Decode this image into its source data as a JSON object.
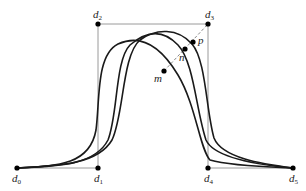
{
  "diagram": {
    "type": "spline control polygon with curves",
    "control_points": [
      {
        "id": "d0",
        "label": "d",
        "sub": "0",
        "x": 17,
        "y": 168
      },
      {
        "id": "d1",
        "label": "d",
        "sub": "1",
        "x": 98,
        "y": 168
      },
      {
        "id": "d2",
        "label": "d",
        "sub": "2",
        "x": 98,
        "y": 24
      },
      {
        "id": "d3",
        "label": "d",
        "sub": "3",
        "x": 208,
        "y": 24
      },
      {
        "id": "d4",
        "label": "d",
        "sub": "4",
        "x": 208,
        "y": 168
      },
      {
        "id": "d5",
        "label": "d",
        "sub": "5",
        "x": 293,
        "y": 168
      }
    ],
    "curve_points": [
      {
        "id": "m",
        "label": "m",
        "x": 164,
        "y": 71
      },
      {
        "id": "n",
        "label": "n",
        "x": 185,
        "y": 49
      },
      {
        "id": "p",
        "label": "p",
        "x": 193,
        "y": 42
      }
    ],
    "curves": [
      {
        "name": "curve-1",
        "path": "M17,168 C60,166 90,164 96,130 C100,100 96,55 118,44 C140,34 160,45 178,75 C196,105 200,150 210,160 C230,166 270,167 293,168"
      },
      {
        "name": "curve-2",
        "path": "M17,168 C60,166 95,165 108,140 C118,115 115,60 130,45 C145,32 162,28 178,45 C194,62 196,110 206,140 C214,158 260,165 293,168"
      },
      {
        "name": "curve-3",
        "path": "M17,168 C60,166 98,164 112,140 C124,115 122,55 140,40 C156,28 178,28 192,44 C206,60 206,110 214,138 C222,158 262,164 293,168"
      }
    ],
    "colors": {
      "curve": "#1a1a1a",
      "polygon": "#9a9a9a",
      "dashed": "#8a8a8a",
      "point": "#000000"
    }
  }
}
